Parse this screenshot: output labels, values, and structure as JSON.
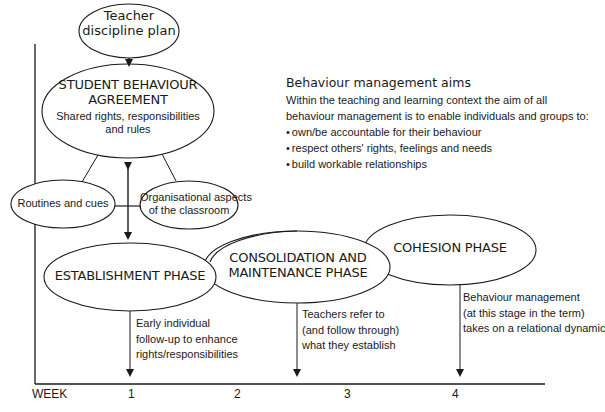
{
  "nodes": {
    "teacher_plan": {
      "line1": "Teacher",
      "line2": "discipline plan"
    },
    "agreement": {
      "title1": "STUDENT BEHAVIOUR",
      "title2": "AGREEMENT",
      "sub1": "Shared rights, responsibilities",
      "sub2": "and rules"
    },
    "routines": {
      "label": "Routines and cues"
    },
    "organisational": {
      "line1": "Organisational aspects",
      "line2": "of the classroom"
    },
    "establishment": {
      "label": "ESTABLISHMENT PHASE"
    },
    "consolidation": {
      "line1": "CONSOLIDATION AND",
      "line2": "MAINTENANCE PHASE"
    },
    "cohesion": {
      "label": "COHESION PHASE"
    }
  },
  "notes": {
    "establishment": {
      "line1": "Early individual",
      "line2": "follow-up to enhance",
      "line3": "rights/responsibilities"
    },
    "consolidation": {
      "line1": "Teachers refer to",
      "line2": "(and follow through)",
      "line3": "what they establish"
    },
    "cohesion": {
      "line1": "Behaviour management",
      "line2": "(at this stage in the term)",
      "line3": "takes on a relational dynamic"
    }
  },
  "aims": {
    "title": "Behaviour management aims",
    "intro1": "Within the teaching and learning context the aim of all",
    "intro2": "behaviour management is to enable individuals and groups to:",
    "bullets": [
      "own/be accountable for their behaviour",
      "respect others' rights, feelings and needs",
      "build workable relationships"
    ]
  },
  "axis": {
    "label": "WEEK",
    "ticks": [
      "1",
      "2",
      "3",
      "4"
    ]
  },
  "colors": {
    "stroke": "#1a1a1a",
    "background": "#ffffff"
  }
}
